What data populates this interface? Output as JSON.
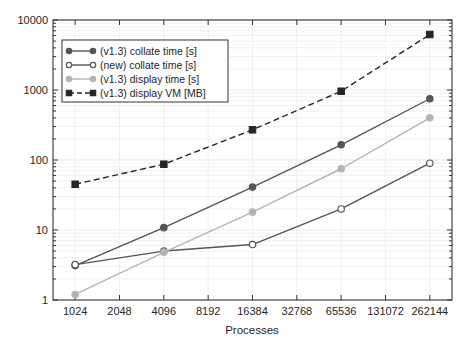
{
  "chart_data": {
    "type": "line",
    "title": "",
    "subtitle": "",
    "xlabel": "Processes",
    "ylabel": "",
    "xscale": "log2",
    "yscale": "log10",
    "grid": true,
    "legend_position": "upper-left-inside",
    "x": [
      1024,
      4096,
      16384,
      65536,
      262144
    ],
    "xtick_labels": [
      "1024",
      "2048",
      "4096",
      "8192",
      "16384",
      "32768",
      "65536",
      "131072",
      "262144"
    ],
    "xtick_values": [
      1024,
      2048,
      4096,
      8192,
      16384,
      32768,
      65536,
      131072,
      262144
    ],
    "ytick_labels": [
      "1",
      "10",
      "100",
      "1000",
      "10000"
    ],
    "ytick_values": [
      1,
      10,
      100,
      1000,
      10000
    ],
    "ylim": [
      1,
      10000
    ],
    "xlim": [
      724,
      370728
    ],
    "series": [
      {
        "name": "(v1.3) collate time [s]",
        "marker": "filled-circle",
        "linestyle": "solid",
        "color": "#555555",
        "x": [
          1024,
          4096,
          16384,
          65536,
          262144
        ],
        "values": [
          3.1,
          10.8,
          41,
          165,
          750
        ]
      },
      {
        "name": "(new) collate time [s]",
        "marker": "open-circle",
        "linestyle": "solid",
        "color": "#555555",
        "x": [
          1024,
          4096,
          16384,
          65536,
          262144
        ],
        "values": [
          3.2,
          5.0,
          6.2,
          20,
          90
        ]
      },
      {
        "name": "(v1.3) display time [s]",
        "marker": "filled-circle",
        "linestyle": "solid",
        "color": "#b4b4b4",
        "x": [
          1024,
          4096,
          16384,
          65536,
          262144
        ],
        "values": [
          1.2,
          4.8,
          18,
          75,
          400
        ]
      },
      {
        "name": "(v1.3) display VM [MB]",
        "marker": "filled-square",
        "linestyle": "dashed",
        "color": "#262626",
        "x": [
          1024,
          4096,
          16384,
          65536,
          262144
        ],
        "values": [
          45,
          87,
          270,
          960,
          6200
        ]
      }
    ]
  },
  "axes": {
    "xlabel": "Processes",
    "ytick_labels": [
      "10000",
      "1000",
      "100",
      "10",
      "1"
    ],
    "xtick_labels": [
      "1024",
      "2048",
      "4096",
      "8192",
      "16384",
      "32768",
      "65536",
      "131072",
      "262144"
    ]
  },
  "legend": {
    "entries": [
      {
        "label": "(v1.3) collate time [s]",
        "marker": "filled-circle",
        "linestyle": "solid",
        "color": "#555555"
      },
      {
        "label": "(new) collate time [s]",
        "marker": "open-circle",
        "linestyle": "solid",
        "color": "#555555"
      },
      {
        "label": "(v1.3) display time [s]",
        "marker": "filled-circle",
        "linestyle": "solid",
        "color": "#b4b4b4"
      },
      {
        "label": "(v1.3) display VM [MB]",
        "marker": "filled-square",
        "linestyle": "dashed",
        "color": "#262626"
      }
    ]
  },
  "colors": {
    "axis": "#333333",
    "grid": "#e8e8e8",
    "background": "#ffffff",
    "dark_gray": "#555555",
    "light_gray": "#b4b4b4",
    "black": "#262626"
  }
}
